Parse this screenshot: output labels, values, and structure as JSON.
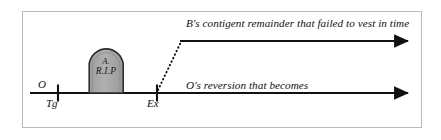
{
  "diagram": {
    "frame": {
      "border_color": "#b9b9b9"
    },
    "colors": {
      "line": "#111111",
      "tombstone_fill": "#a8a8a8",
      "tombstone_stroke": "#2a2a2a",
      "text": "#111111",
      "frame_border": "#b9b9b9",
      "background": "#ffffff"
    },
    "timeline": {
      "name": "main-timeline-axis",
      "baseline_y": 93,
      "start_x": 30,
      "end_x": 414,
      "ticks": [
        {
          "id": "tick-tg",
          "x": 58,
          "label_above": "O",
          "label_below": "Tg"
        },
        {
          "id": "tick-ex",
          "x": 157,
          "label_above": "",
          "label_below": "Ex"
        }
      ]
    },
    "labels": {
      "o": "O",
      "tg": "Tg",
      "ex": "Ex",
      "lower_annotation": "O's reversion that becomes",
      "upper_annotation": "B's contigent remainder that failed to vest in time"
    },
    "tombstone": {
      "name": "tombstone-grave-marker",
      "line1": "A.",
      "line2": "R.I.P",
      "x": 88,
      "y": 45,
      "width": 36,
      "height": 48
    },
    "upper_branch": {
      "name": "upper-branch-arrow",
      "horizontal_y": 41,
      "start_x": 181,
      "end_x": 414,
      "dotted_from": {
        "x": 158,
        "y": 90
      },
      "dotted_to": {
        "x": 181,
        "y": 41
      },
      "style": "dotted-riser-then-solid-arrow"
    }
  }
}
